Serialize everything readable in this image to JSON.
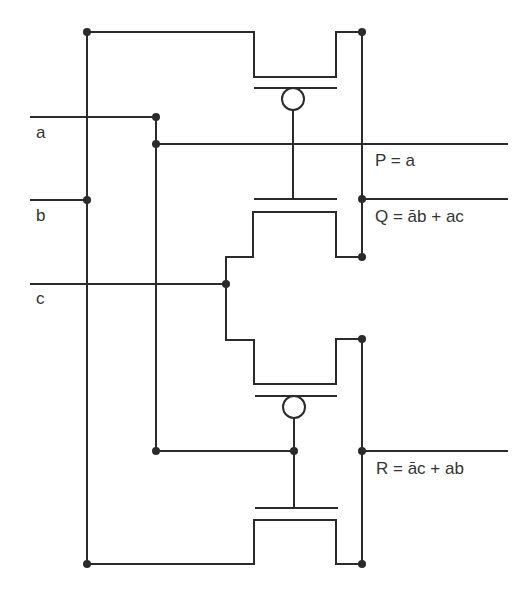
{
  "diagram": {
    "type": "CMOS transmission-gate logic circuit",
    "inputs": [
      {
        "id": "a",
        "label": "a"
      },
      {
        "id": "b",
        "label": "b"
      },
      {
        "id": "c",
        "label": "c"
      }
    ],
    "outputs": [
      {
        "id": "P",
        "label": "P = a"
      },
      {
        "id": "Q",
        "label": "Q = āb + ac"
      },
      {
        "id": "R",
        "label": "R = āc + ab"
      }
    ],
    "components": [
      {
        "id": "tg1-pmos",
        "kind": "pmos",
        "gate": "a"
      },
      {
        "id": "tg1-nmos",
        "kind": "nmos",
        "gate": "a"
      },
      {
        "id": "tg2-pmos",
        "kind": "pmos",
        "gate": "a"
      },
      {
        "id": "tg2-nmos",
        "kind": "nmos",
        "gate": "a"
      }
    ]
  }
}
